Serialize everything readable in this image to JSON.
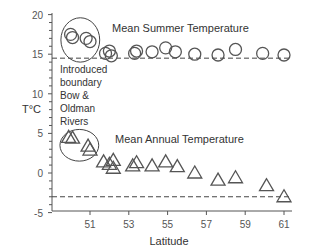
{
  "chart_data": {
    "type": "scatter",
    "title": "",
    "xlabel": "Latitude",
    "ylabel": "T°C",
    "xlim": [
      49.1,
      61.8
    ],
    "ylim": [
      -5,
      20
    ],
    "x_ticks": [
      51,
      53,
      55,
      57,
      59,
      61
    ],
    "y_ticks": [
      -5,
      0,
      5,
      10,
      15,
      20
    ],
    "grid": false,
    "legend": "none",
    "series": [
      {
        "name": "Mean Summer Temperature",
        "marker": "circle",
        "points": [
          {
            "x": 50.0,
            "y": 17.5
          },
          {
            "x": 50.1,
            "y": 17.1
          },
          {
            "x": 50.8,
            "y": 17.0
          },
          {
            "x": 51.0,
            "y": 16.6
          },
          {
            "x": 51.8,
            "y": 15.1
          },
          {
            "x": 52.0,
            "y": 15.4
          },
          {
            "x": 52.1,
            "y": 14.8
          },
          {
            "x": 53.3,
            "y": 15.1
          },
          {
            "x": 53.4,
            "y": 15.4
          },
          {
            "x": 54.2,
            "y": 15.3
          },
          {
            "x": 54.9,
            "y": 15.8
          },
          {
            "x": 55.4,
            "y": 15.3
          },
          {
            "x": 56.4,
            "y": 15.0
          },
          {
            "x": 57.6,
            "y": 14.9
          },
          {
            "x": 58.5,
            "y": 15.6
          },
          {
            "x": 59.9,
            "y": 15.1
          },
          {
            "x": 61.0,
            "y": 14.9
          }
        ]
      },
      {
        "name": "Mean Annual Temperature",
        "marker": "triangle",
        "points": [
          {
            "x": 49.9,
            "y": 4.5
          },
          {
            "x": 50.1,
            "y": 4.4
          },
          {
            "x": 50.9,
            "y": 3.4
          },
          {
            "x": 51.0,
            "y": 2.9
          },
          {
            "x": 51.7,
            "y": 1.4
          },
          {
            "x": 52.0,
            "y": 1.1
          },
          {
            "x": 52.2,
            "y": 1.6
          },
          {
            "x": 52.2,
            "y": 0.6
          },
          {
            "x": 53.2,
            "y": 0.9
          },
          {
            "x": 53.4,
            "y": 1.3
          },
          {
            "x": 54.2,
            "y": 0.9
          },
          {
            "x": 54.9,
            "y": 1.4
          },
          {
            "x": 55.5,
            "y": 0.8
          },
          {
            "x": 56.4,
            "y": 0.0
          },
          {
            "x": 57.6,
            "y": -0.9
          },
          {
            "x": 58.5,
            "y": -0.6
          },
          {
            "x": 60.1,
            "y": -1.6
          },
          {
            "x": 61.0,
            "y": -3.0
          }
        ]
      }
    ],
    "reference_lines": [
      {
        "y": 14.5,
        "style": "dashed",
        "label": "summer threshold"
      },
      {
        "y": -3.0,
        "style": "dashed",
        "label": "annual threshold"
      }
    ],
    "annotations": [
      {
        "text": "Mean Summer Temperature",
        "x": 53.2,
        "y": 17.6
      },
      {
        "text": "Mean Annual Temperature",
        "x": 53.1,
        "y": 4.2
      },
      {
        "text": "Introduced boundary Bow & Oldman Rivers",
        "lines": [
          "Introduced",
          "boundary",
          "Bow &",
          "Oldman",
          "Rivers"
        ],
        "x": 50.3,
        "y": 12.5
      },
      {
        "text": "ellipse around summer cluster",
        "shape": "ellipse",
        "cx": 50.5,
        "cy": 16.8,
        "rx": 1.0,
        "ry": 2.8
      },
      {
        "text": "ellipse around annual cluster",
        "shape": "ellipse",
        "cx": 50.45,
        "cy": 3.5,
        "rx": 1.0,
        "ry": 2.0
      }
    ]
  },
  "labels": {
    "y_axis": "T°C",
    "x_axis": "Latitude",
    "summer": "Mean Summer Temperature",
    "annual": "Mean Annual Temperature",
    "boundary_lines": [
      "Introduced",
      "boundary",
      "Bow &",
      "Oldman",
      "Rivers"
    ]
  },
  "colors": {
    "axis": "#555555",
    "marker": "#555555",
    "text": "#333333"
  }
}
